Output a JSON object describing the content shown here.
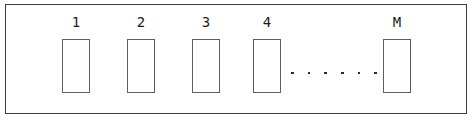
{
  "diagram": {
    "name": "memory-cell-array",
    "frame": {
      "border_color": "#3d3d3d",
      "background_color": "#ffffff"
    },
    "cell_box": {
      "border_color": "#5f5f5f",
      "fill_color": "#ffffff",
      "width_px": 28,
      "height_px": 54
    },
    "label_color": "#1c1c1c",
    "cells": [
      {
        "label": "1",
        "left_px": 54
      },
      {
        "label": "2",
        "left_px": 119
      },
      {
        "label": "3",
        "left_px": 184
      },
      {
        "label": "4",
        "left_px": 245
      },
      {
        "label": "M",
        "left_px": 375
      }
    ],
    "ellipsis": {
      "label": ". . . . . .",
      "dot_count": 6,
      "dot_color": "#2b2b2b"
    }
  }
}
